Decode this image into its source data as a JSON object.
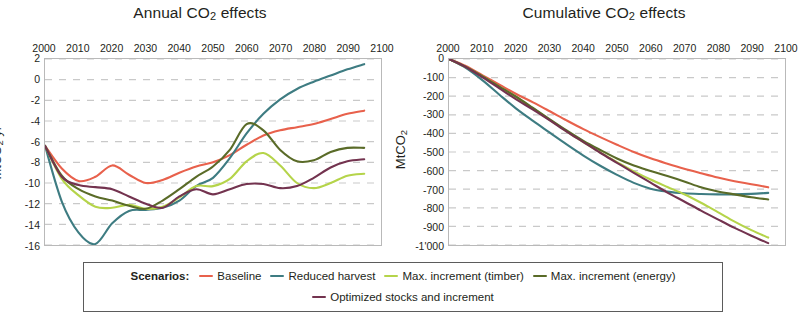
{
  "chart_data": [
    {
      "type": "line",
      "title": "Annual CO2 effects",
      "title_rich": {
        "pre": "Annual CO",
        "sub": "2",
        "post": " effects"
      },
      "xlabel": "",
      "ylabel": "MtCO2 yr-1",
      "ylabel_rich": {
        "pre": "MtCO",
        "sub": "2",
        "mid": " yr",
        "sup": "-1"
      },
      "xlim": [
        2000,
        2100
      ],
      "ylim": [
        -16,
        2
      ],
      "xticks": [
        2000,
        2010,
        2020,
        2030,
        2040,
        2050,
        2060,
        2070,
        2080,
        2090,
        2100
      ],
      "yticks": [
        2,
        0,
        -2,
        -4,
        -6,
        -8,
        -10,
        -12,
        -14,
        -16
      ],
      "xtick_labels": [
        "2000",
        "2010",
        "2020",
        "2030",
        "2040",
        "2050",
        "2060",
        "2070",
        "2080",
        "2090",
        "2100"
      ],
      "ytick_labels": [
        "2",
        "0",
        "-2",
        "-4",
        "-6",
        "-8",
        "-10",
        "-12",
        "-14",
        "-16"
      ],
      "xaxis_position": "top",
      "grid": true,
      "x": [
        2000,
        2005,
        2010,
        2015,
        2020,
        2025,
        2030,
        2035,
        2040,
        2045,
        2050,
        2055,
        2060,
        2065,
        2070,
        2075,
        2080,
        2085,
        2090,
        2095
      ],
      "series": [
        {
          "name": "Baseline",
          "color": "#E8614C",
          "values": [
            -6.4,
            -8.6,
            -9.8,
            -9.4,
            -8.3,
            -9.2,
            -10.0,
            -9.7,
            -9.0,
            -8.4,
            -8.0,
            -7.3,
            -6.3,
            -5.4,
            -4.9,
            -4.6,
            -4.3,
            -3.8,
            -3.3,
            -3.0
          ]
        },
        {
          "name": "Reduced harvest",
          "color": "#3E7C82",
          "values": [
            -6.4,
            -11.8,
            -14.8,
            -15.9,
            -13.9,
            -12.7,
            -12.6,
            -12.4,
            -11.7,
            -10.3,
            -9.5,
            -7.6,
            -5.2,
            -3.3,
            -1.9,
            -0.9,
            -0.2,
            0.4,
            1.0,
            1.5
          ]
        },
        {
          "name": "Max. increment (timber)",
          "color": "#B5D44A",
          "values": [
            -6.4,
            -9.6,
            -11.2,
            -12.3,
            -12.4,
            -12.1,
            -12.5,
            -12.3,
            -11.4,
            -10.3,
            -10.3,
            -9.6,
            -7.9,
            -7.1,
            -8.3,
            -10.0,
            -10.5,
            -10.0,
            -9.3,
            -9.1
          ]
        },
        {
          "name": "Max. increment (energy)",
          "color": "#5A6B28",
          "values": [
            -6.4,
            -9.3,
            -10.6,
            -11.3,
            -11.7,
            -12.2,
            -12.5,
            -11.7,
            -10.6,
            -9.4,
            -8.4,
            -6.8,
            -4.3,
            -4.9,
            -6.8,
            -7.9,
            -7.8,
            -7.0,
            -6.6,
            -6.6
          ]
        },
        {
          "name": "Optimized stocks and increment",
          "color": "#73334F",
          "values": [
            -6.4,
            -9.4,
            -10.2,
            -10.4,
            -10.6,
            -11.3,
            -12.0,
            -12.4,
            -11.3,
            -10.6,
            -11.1,
            -10.6,
            -10.1,
            -10.1,
            -10.5,
            -10.3,
            -9.5,
            -8.5,
            -7.9,
            -7.7
          ]
        }
      ]
    },
    {
      "type": "line",
      "title": "Cumulative CO2 effects",
      "title_rich": {
        "pre": "Cumulative CO",
        "sub": "2",
        "post": " effects"
      },
      "xlabel": "",
      "ylabel": "MtCO2",
      "ylabel_rich": {
        "pre": "MtCO",
        "sub": "2",
        "mid": "",
        "sup": ""
      },
      "xlim": [
        2000,
        2100
      ],
      "ylim": [
        -1000,
        0
      ],
      "xticks": [
        2000,
        2010,
        2020,
        2030,
        2040,
        2050,
        2060,
        2070,
        2080,
        2090,
        2100
      ],
      "yticks": [
        0,
        -100,
        -200,
        -300,
        -400,
        -500,
        -600,
        -700,
        -800,
        -900,
        -1000
      ],
      "xtick_labels": [
        "2000",
        "2010",
        "2020",
        "2030",
        "2040",
        "2050",
        "2060",
        "2070",
        "2080",
        "2090",
        "2100"
      ],
      "ytick_labels": [
        "0",
        "-100",
        "-200",
        "-300",
        "-400",
        "-500",
        "-600",
        "-700",
        "-800",
        "-900",
        "-1'000"
      ],
      "xaxis_position": "top",
      "grid": true,
      "x": [
        2000,
        2005,
        2010,
        2015,
        2020,
        2025,
        2030,
        2035,
        2040,
        2045,
        2050,
        2055,
        2060,
        2065,
        2070,
        2075,
        2080,
        2085,
        2090,
        2095
      ],
      "series": [
        {
          "name": "Baseline",
          "color": "#E8614C",
          "values": [
            0,
            -38,
            -88,
            -138,
            -188,
            -233,
            -281,
            -330,
            -377,
            -420,
            -461,
            -500,
            -534,
            -563,
            -590,
            -614,
            -637,
            -657,
            -673,
            -690
          ]
        },
        {
          "name": "Reduced harvest",
          "color": "#3E7C82",
          "values": [
            0,
            -48,
            -115,
            -192,
            -267,
            -333,
            -396,
            -459,
            -519,
            -574,
            -623,
            -666,
            -697,
            -713,
            -722,
            -726,
            -728,
            -728,
            -725,
            -720
          ]
        },
        {
          "name": "Max. increment (timber)",
          "color": "#B5D44A",
          "values": [
            0,
            -42,
            -94,
            -150,
            -205,
            -266,
            -327,
            -389,
            -447,
            -502,
            -554,
            -604,
            -648,
            -688,
            -727,
            -773,
            -823,
            -874,
            -920,
            -960
          ]
        },
        {
          "name": "Max. increment (energy)",
          "color": "#5A6B28",
          "values": [
            0,
            -42,
            -93,
            -148,
            -203,
            -263,
            -324,
            -384,
            -440,
            -489,
            -535,
            -573,
            -602,
            -629,
            -658,
            -690,
            -712,
            -728,
            -743,
            -755
          ]
        },
        {
          "name": "Optimized stocks and increment",
          "color": "#73334F",
          "values": [
            0,
            -43,
            -99,
            -158,
            -217,
            -272,
            -330,
            -390,
            -447,
            -504,
            -558,
            -612,
            -665,
            -718,
            -766,
            -815,
            -862,
            -908,
            -950,
            -990
          ]
        }
      ]
    }
  ],
  "legend": {
    "title": "Scenarios:",
    "items": [
      {
        "label": "Baseline",
        "color": "#E8614C"
      },
      {
        "label": "Reduced harvest",
        "color": "#3E7C82"
      },
      {
        "label": "Max. increment (timber)",
        "color": "#B5D44A"
      },
      {
        "label": "Max. increment (energy)",
        "color": "#5A6B28"
      },
      {
        "label": "Optimized stocks and increment",
        "color": "#73334F"
      }
    ]
  }
}
